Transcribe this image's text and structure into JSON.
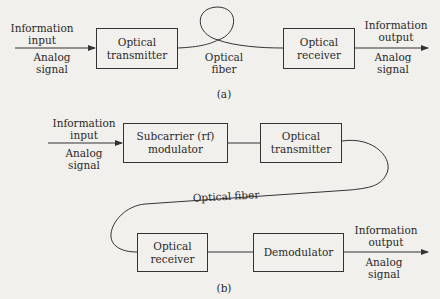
{
  "figure_a": {
    "caption": "(a)",
    "input": {
      "top": "Information",
      "mid": "input",
      "bot1": "Analog",
      "bot2": "signal"
    },
    "transmitter": {
      "line1": "Optical",
      "line2": "transmitter"
    },
    "fiber": {
      "line1": "Optical",
      "line2": "fiber"
    },
    "receiver": {
      "line1": "Optical",
      "line2": "receiver"
    },
    "output": {
      "top": "Information",
      "mid": "output",
      "bot1": "Analog",
      "bot2": "signal"
    }
  },
  "figure_b": {
    "caption": "(b)",
    "input": {
      "top": "Information",
      "mid": "input",
      "bot1": "Analog",
      "bot2": "signal"
    },
    "modulator": {
      "line1": "Subcarrier (rf)",
      "line2": "modulator"
    },
    "transmitter": {
      "line1": "Optical",
      "line2": "transmitter"
    },
    "fiber": {
      "label": "Optical fiber"
    },
    "receiver": {
      "line1": "Optical",
      "line2": "receiver"
    },
    "demodulator": {
      "line1": "Demodulator"
    },
    "output": {
      "top": "Information",
      "mid": "output",
      "bot1": "Analog",
      "bot2": "signal"
    }
  }
}
